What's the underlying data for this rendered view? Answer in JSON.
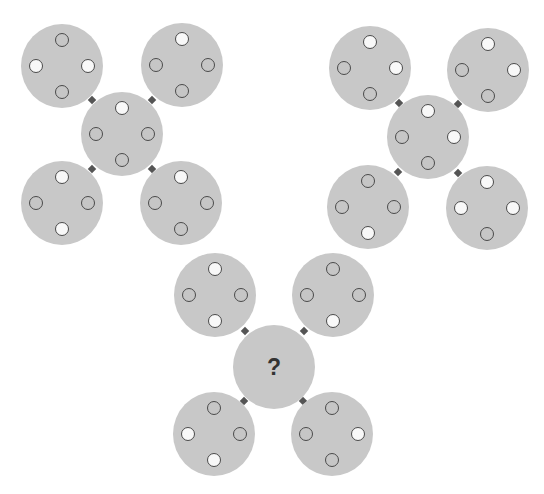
{
  "puzzle": {
    "description": "Three flower-shaped groups of five discs; each disc has four dots (top, left, right, bottom) that are white or gray. The center disc of the third group is unknown.",
    "colors": {
      "disc_fill": "#c8c8c8",
      "dot_white": "#f8f8f8",
      "dot_gray": "#c6c6c6",
      "dot_outline": "#4a4a4a",
      "connector": "#555555",
      "question_mark": "#333333"
    },
    "question_mark": "?",
    "groups": [
      {
        "name": "group-1",
        "discs": [
          {
            "pos": "top-left",
            "cx": 62,
            "cy": 66,
            "dots": {
              "top": "gray",
              "left": "white",
              "right": "white",
              "bottom": "gray"
            }
          },
          {
            "pos": "top-right",
            "cx": 182,
            "cy": 65,
            "dots": {
              "top": "white",
              "left": "gray",
              "right": "gray",
              "bottom": "gray"
            }
          },
          {
            "pos": "center",
            "cx": 122,
            "cy": 134,
            "dots": {
              "top": "white",
              "left": "gray",
              "right": "gray",
              "bottom": "gray"
            }
          },
          {
            "pos": "bottom-left",
            "cx": 62,
            "cy": 203,
            "dots": {
              "top": "white",
              "left": "gray",
              "right": "gray",
              "bottom": "white"
            }
          },
          {
            "pos": "bottom-right",
            "cx": 181,
            "cy": 203,
            "dots": {
              "top": "white",
              "left": "gray",
              "right": "gray",
              "bottom": "gray"
            }
          }
        ]
      },
      {
        "name": "group-2",
        "discs": [
          {
            "pos": "top-left",
            "cx": 370,
            "cy": 68,
            "dots": {
              "top": "white",
              "left": "gray",
              "right": "white",
              "bottom": "gray"
            }
          },
          {
            "pos": "top-right",
            "cx": 488,
            "cy": 70,
            "dots": {
              "top": "white",
              "left": "gray",
              "right": "white",
              "bottom": "gray"
            }
          },
          {
            "pos": "center",
            "cx": 428,
            "cy": 137,
            "dots": {
              "top": "white",
              "left": "gray",
              "right": "white",
              "bottom": "gray"
            }
          },
          {
            "pos": "bottom-left",
            "cx": 368,
            "cy": 207,
            "dots": {
              "top": "gray",
              "left": "gray",
              "right": "gray",
              "bottom": "white"
            }
          },
          {
            "pos": "bottom-right",
            "cx": 487,
            "cy": 208,
            "dots": {
              "top": "white",
              "left": "white",
              "right": "white",
              "bottom": "gray"
            }
          }
        ]
      },
      {
        "name": "group-3",
        "discs": [
          {
            "pos": "top-left",
            "cx": 215,
            "cy": 295,
            "dots": {
              "top": "white",
              "left": "gray",
              "right": "gray",
              "bottom": "white"
            }
          },
          {
            "pos": "top-right",
            "cx": 333,
            "cy": 295,
            "dots": {
              "top": "gray",
              "left": "gray",
              "right": "gray",
              "bottom": "white"
            }
          },
          {
            "pos": "center",
            "cx": 274,
            "cy": 367,
            "unknown": true
          },
          {
            "pos": "bottom-left",
            "cx": 214,
            "cy": 434,
            "dots": {
              "top": "gray",
              "left": "white",
              "right": "gray",
              "bottom": "white"
            }
          },
          {
            "pos": "bottom-right",
            "cx": 332,
            "cy": 434,
            "dots": {
              "top": "gray",
              "left": "gray",
              "right": "white",
              "bottom": "gray"
            }
          }
        ]
      }
    ]
  }
}
